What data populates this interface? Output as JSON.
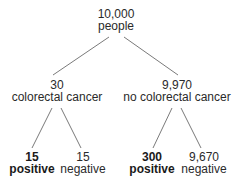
{
  "root": {
    "count": "10,000",
    "label": "people"
  },
  "branches": [
    {
      "count": "30",
      "label": "colorectal cancer",
      "leaves": [
        {
          "count": "15",
          "label": "positive",
          "bold": true
        },
        {
          "count": "15",
          "label": "negative",
          "bold": false
        }
      ]
    },
    {
      "count": "9,970",
      "label": "no colorectal cancer",
      "leaves": [
        {
          "count": "300",
          "label": "positive",
          "bold": true
        },
        {
          "count": "9,670",
          "label": "negative",
          "bold": false
        }
      ]
    }
  ],
  "colors": {
    "line": "#7a7a7a",
    "text": "#2a2a2a"
  }
}
